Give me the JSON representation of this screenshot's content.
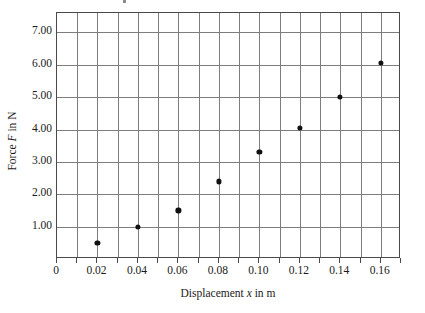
{
  "chart_data": {
    "type": "scatter",
    "title": "",
    "xlabel": "Displacement x in m",
    "ylabel": "Force F in N",
    "x": [
      0.02,
      0.04,
      0.06,
      0.08,
      0.1,
      0.12,
      0.14,
      0.16
    ],
    "values": [
      0.5,
      1.0,
      1.5,
      2.4,
      3.3,
      4.05,
      5.0,
      6.05
    ],
    "xlim": [
      0.0,
      0.17
    ],
    "ylim": [
      0.0,
      7.6
    ],
    "xticks": [
      0,
      0.02,
      0.04,
      0.06,
      0.08,
      0.1,
      0.12,
      0.14,
      0.16
    ],
    "xtick_labels": [
      "0",
      "0.02",
      "0.04",
      "0.06",
      "0.08",
      "0.10",
      "0.12",
      "0.14",
      "0.16"
    ],
    "yticks": [
      1,
      2,
      3,
      4,
      5,
      6,
      7
    ],
    "ytick_labels": [
      "1.00",
      "2.00",
      "3.00",
      "4.00",
      "5.00",
      "6.00",
      "7.00"
    ],
    "grid": true,
    "grid_minor_x_step": 0.01,
    "grid_major_y_step": 1.0,
    "legend": null,
    "marker": "filled-circle",
    "marker_color": "#111111",
    "grid_color": "#7d7d7d",
    "axis_color": "#4a4a4a"
  },
  "axis_titles": {
    "y_prefix": "Force ",
    "y_italic": "F",
    "y_suffix": " in N",
    "x_prefix": "Displacement ",
    "x_italic": "x",
    "x_suffix": " in m"
  }
}
